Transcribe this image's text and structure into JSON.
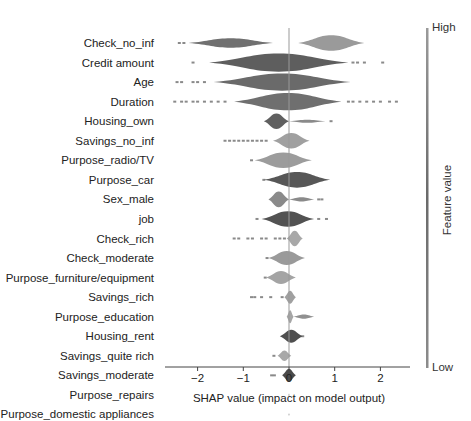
{
  "chart_data": {
    "type": "violin",
    "title": "",
    "xlabel": "SHAP value (impact on model output)",
    "ylabel": "",
    "xlim": [
      -2.65,
      2.55
    ],
    "xticks": [
      -2,
      -1,
      0,
      1,
      2
    ],
    "xtick_labels": [
      "−2",
      "−1",
      "0",
      "1",
      "2"
    ],
    "grid": false,
    "zero_line": true,
    "colorbar": {
      "title": "Feature value",
      "high_label": "High",
      "low_label": "Low",
      "colormap": "grayscale"
    },
    "features": [
      {
        "name": "Check_no_inf",
        "range": [
          -2.5,
          1.8
        ],
        "shape": [
          [
            -2.2,
            -0.35,
            0.18,
            "#707070"
          ],
          [
            0.2,
            1.65,
            0.3,
            "#9a9a9a"
          ]
        ],
        "outliers": [
          -2.4,
          -2.3
        ]
      },
      {
        "name": "Credit amount",
        "range": [
          -2.2,
          2.2
        ],
        "shape": [
          [
            -1.75,
            1.3,
            0.35,
            "#5e5e5e"
          ]
        ],
        "outliers": [
          -2.1,
          1.4,
          1.5,
          1.65,
          2.05
        ]
      },
      {
        "name": "Age",
        "range": [
          -2.5,
          1.45
        ],
        "shape": [
          [
            -1.65,
            1.35,
            0.33,
            "#6a6a6a"
          ]
        ],
        "outliers": [
          -2.45,
          -2.35,
          -2.1,
          -2.0,
          -1.85
        ]
      },
      {
        "name": "Duration",
        "range": [
          -2.5,
          2.35
        ],
        "shape": [
          [
            -1.2,
            1.15,
            0.33,
            "#6f6f6f"
          ]
        ],
        "outliers": [
          -2.5,
          -2.35,
          -2.25,
          -2.1,
          -2.0,
          -1.85,
          -1.7,
          -1.55,
          -1.4,
          1.3,
          1.4,
          1.55,
          1.7,
          1.85,
          2.0,
          2.2,
          2.35
        ]
      },
      {
        "name": "Housing_own",
        "range": [
          -0.55,
          0.95
        ],
        "shape": [
          [
            -0.55,
            0.0,
            0.3,
            "#606060"
          ],
          [
            0.0,
            0.8,
            0.06,
            "#8a8a8a"
          ]
        ],
        "outliers": [
          0.92
        ]
      },
      {
        "name": "Savings_no_inf",
        "range": [
          -1.45,
          0.45
        ],
        "shape": [
          [
            -0.35,
            0.45,
            0.3,
            "#a0a0a0"
          ]
        ],
        "outliers": [
          -1.4,
          -1.3,
          -1.2,
          -1.1,
          -1.0,
          -0.9,
          -0.8,
          -0.7,
          -0.6,
          -0.5
        ]
      },
      {
        "name": "Purpose_radio/TV",
        "range": [
          -0.85,
          0.5
        ],
        "shape": [
          [
            -0.75,
            0.5,
            0.3,
            "#9c9c9c"
          ]
        ],
        "outliers": [
          -0.82
        ]
      },
      {
        "name": "Purpose_car",
        "range": [
          -0.55,
          0.9
        ],
        "shape": [
          [
            -0.55,
            0.9,
            0.3,
            "#575757"
          ]
        ],
        "outliers": [
          -0.55
        ]
      },
      {
        "name": "Sex_male",
        "range": [
          -0.45,
          0.75
        ],
        "shape": [
          [
            -0.45,
            0.0,
            0.3,
            "#8a8a8a"
          ],
          [
            0.0,
            0.55,
            0.08,
            "#8a8a8a"
          ]
        ],
        "outliers": [
          0.65,
          0.72
        ]
      },
      {
        "name": "job",
        "range": [
          -0.75,
          0.85
        ],
        "shape": [
          [
            -0.6,
            0.55,
            0.3,
            "#525252"
          ]
        ],
        "outliers": [
          -0.7,
          0.65,
          0.82
        ]
      },
      {
        "name": "Check_rich",
        "range": [
          -1.25,
          0.3
        ],
        "shape": [
          [
            -0.05,
            0.3,
            0.3,
            "#a8a8a8"
          ]
        ],
        "outliers": [
          -1.2,
          -1.1,
          -0.9,
          -0.8,
          -0.6,
          -0.5,
          -0.3,
          -0.2,
          -0.1
        ]
      },
      {
        "name": "Check_moderate",
        "range": [
          -0.5,
          0.35
        ],
        "shape": [
          [
            -0.45,
            0.35,
            0.27,
            "#9a9a9a"
          ]
        ],
        "outliers": [
          -0.48
        ]
      },
      {
        "name": "Purpose_furniture/equipment",
        "range": [
          -0.55,
          0.15
        ],
        "shape": [
          [
            -0.5,
            0.15,
            0.25,
            "#a4a4a4"
          ]
        ],
        "outliers": [
          -0.52
        ]
      },
      {
        "name": "Savings_rich",
        "range": [
          -0.85,
          0.15
        ],
        "shape": [
          [
            -0.1,
            0.15,
            0.25,
            "#a0a0a0"
          ]
        ],
        "outliers": [
          -0.82,
          -0.75,
          -0.6,
          -0.4,
          -0.15
        ]
      },
      {
        "name": "Purpose_education",
        "range": [
          -0.05,
          0.55
        ],
        "shape": [
          [
            -0.05,
            0.1,
            0.25,
            "#a6a6a6"
          ],
          [
            0.1,
            0.55,
            0.08,
            "#909090"
          ]
        ],
        "outliers": []
      },
      {
        "name": "Housing_rent",
        "range": [
          -0.2,
          0.3
        ],
        "shape": [
          [
            -0.2,
            0.3,
            0.25,
            "#4f4f4f"
          ]
        ],
        "outliers": [
          0.3
        ]
      },
      {
        "name": "Savings_quite rich",
        "range": [
          -0.35,
          0.05
        ],
        "shape": [
          [
            -0.25,
            0.05,
            0.2,
            "#a8a8a8"
          ]
        ],
        "outliers": [
          -0.33
        ]
      },
      {
        "name": "Savings_moderate",
        "range": [
          -0.4,
          0.15
        ],
        "shape": [
          [
            -0.15,
            0.15,
            0.25,
            "#4a4a4a"
          ]
        ],
        "outliers": [
          -0.38,
          -0.32
        ]
      },
      {
        "name": "Purpose_repairs",
        "range": [
          0.0,
          0.0
        ],
        "shape": [
          [
            -0.01,
            0.01,
            0.05,
            "#888888"
          ]
        ],
        "outliers": []
      },
      {
        "name": "Purpose_domestic appliances",
        "range": [
          0.0,
          0.0
        ],
        "shape": [
          [
            -0.01,
            0.01,
            0.05,
            "#888888"
          ]
        ],
        "outliers": []
      }
    ]
  }
}
